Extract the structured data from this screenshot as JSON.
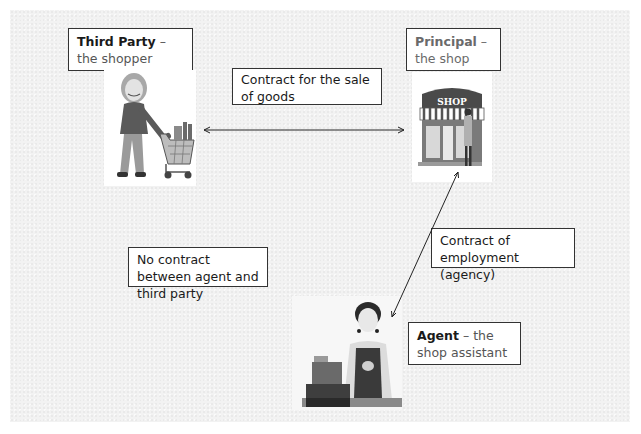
{
  "diagram": {
    "nodes": {
      "third_party": {
        "bold": "Third Party",
        "rest": " – the shopper",
        "image": "shopper-with-trolley"
      },
      "principal": {
        "bold": "Principal",
        "rest": " – the shop owner",
        "image": "shop-front-with-owner"
      },
      "agent": {
        "bold": "Agent",
        "rest": " – the shop assistant",
        "image": "shop-assistant-at-till"
      }
    },
    "edges": {
      "sale_of_goods": {
        "label": "Contract for the sale of goods",
        "from": "third_party",
        "to": "principal",
        "style": "double-headed-arrow"
      },
      "employment": {
        "label": "Contract of employment (agency)",
        "from": "agent",
        "to": "principal",
        "style": "double-headed-arrow"
      },
      "no_contract": {
        "label": "No contract between agent and third party",
        "from": "agent",
        "to": "third_party",
        "style": "none"
      }
    },
    "shop_sign": "SHOP"
  }
}
